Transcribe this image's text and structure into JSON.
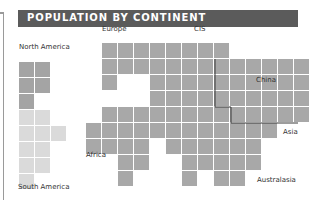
{
  "chart_data": {
    "type": "table",
    "subtype": "tile-map (cartogram)",
    "title": "POPULATION BY CONTINENT",
    "cell_size_px": 16,
    "colors": {
      "title_bar": "#5b5b5b",
      "title_text": "#ffffff",
      "tile_default": "#a8a8a8",
      "tile_north_america": "#a4a4a4",
      "tile_south_america": "#dadada",
      "border_line": "#3a3a3a"
    },
    "regions": [
      {
        "name": "North America",
        "label_x": 19,
        "label_y": 51
      },
      {
        "name": "South America",
        "label_x": 18,
        "label_y": 191
      },
      {
        "name": "Europe",
        "label_x": 102,
        "label_y": 33
      },
      {
        "name": "CIS",
        "label_x": 194,
        "label_y": 33
      },
      {
        "name": "China",
        "label_x": 256,
        "label_y": 84
      },
      {
        "name": "Asia",
        "label_x": 283,
        "label_y": 136
      },
      {
        "name": "Africa",
        "label_x": 86,
        "label_y": 159
      },
      {
        "name": "Australasia",
        "label_x": 257,
        "label_y": 184
      }
    ],
    "tiles": [
      {
        "x": 19,
        "y": 62,
        "r": "na"
      },
      {
        "x": 35,
        "y": 62,
        "r": "na"
      },
      {
        "x": 19,
        "y": 78,
        "r": "na"
      },
      {
        "x": 35,
        "y": 78,
        "r": "na"
      },
      {
        "x": 19,
        "y": 94,
        "r": "na"
      },
      {
        "x": 19,
        "y": 110,
        "r": "sa"
      },
      {
        "x": 35,
        "y": 110,
        "r": "sa"
      },
      {
        "x": 19,
        "y": 126,
        "r": "sa"
      },
      {
        "x": 35,
        "y": 126,
        "r": "sa"
      },
      {
        "x": 51,
        "y": 126,
        "r": "sa"
      },
      {
        "x": 19,
        "y": 142,
        "r": "sa"
      },
      {
        "x": 35,
        "y": 142,
        "r": "sa"
      },
      {
        "x": 19,
        "y": 158,
        "r": "sa"
      },
      {
        "x": 35,
        "y": 158,
        "r": "sa"
      },
      {
        "x": 19,
        "y": 174,
        "r": "sa"
      },
      {
        "x": 102,
        "y": 43
      },
      {
        "x": 118,
        "y": 43
      },
      {
        "x": 134,
        "y": 43
      },
      {
        "x": 150,
        "y": 43
      },
      {
        "x": 166,
        "y": 43
      },
      {
        "x": 182,
        "y": 43
      },
      {
        "x": 198,
        "y": 43
      },
      {
        "x": 214,
        "y": 43
      },
      {
        "x": 102,
        "y": 59
      },
      {
        "x": 118,
        "y": 59
      },
      {
        "x": 134,
        "y": 59
      },
      {
        "x": 150,
        "y": 59
      },
      {
        "x": 166,
        "y": 59
      },
      {
        "x": 182,
        "y": 59
      },
      {
        "x": 198,
        "y": 59
      },
      {
        "x": 214,
        "y": 59
      },
      {
        "x": 230,
        "y": 59
      },
      {
        "x": 246,
        "y": 59
      },
      {
        "x": 262,
        "y": 59
      },
      {
        "x": 278,
        "y": 59
      },
      {
        "x": 294,
        "y": 59
      },
      {
        "x": 102,
        "y": 75
      },
      {
        "x": 150,
        "y": 75
      },
      {
        "x": 166,
        "y": 75
      },
      {
        "x": 182,
        "y": 75
      },
      {
        "x": 198,
        "y": 75
      },
      {
        "x": 214,
        "y": 75
      },
      {
        "x": 230,
        "y": 75
      },
      {
        "x": 246,
        "y": 75
      },
      {
        "x": 262,
        "y": 75
      },
      {
        "x": 278,
        "y": 75
      },
      {
        "x": 294,
        "y": 75
      },
      {
        "x": 150,
        "y": 91
      },
      {
        "x": 166,
        "y": 91
      },
      {
        "x": 182,
        "y": 91
      },
      {
        "x": 198,
        "y": 91
      },
      {
        "x": 214,
        "y": 91
      },
      {
        "x": 230,
        "y": 91
      },
      {
        "x": 246,
        "y": 91
      },
      {
        "x": 262,
        "y": 91
      },
      {
        "x": 278,
        "y": 91
      },
      {
        "x": 294,
        "y": 91
      },
      {
        "x": 102,
        "y": 107
      },
      {
        "x": 118,
        "y": 107
      },
      {
        "x": 134,
        "y": 107
      },
      {
        "x": 150,
        "y": 107
      },
      {
        "x": 166,
        "y": 107
      },
      {
        "x": 182,
        "y": 107
      },
      {
        "x": 198,
        "y": 107
      },
      {
        "x": 214,
        "y": 107
      },
      {
        "x": 230,
        "y": 107
      },
      {
        "x": 246,
        "y": 107
      },
      {
        "x": 262,
        "y": 107
      },
      {
        "x": 278,
        "y": 107
      },
      {
        "x": 294,
        "y": 107
      },
      {
        "x": 86,
        "y": 123
      },
      {
        "x": 102,
        "y": 123
      },
      {
        "x": 118,
        "y": 123
      },
      {
        "x": 134,
        "y": 123
      },
      {
        "x": 150,
        "y": 123
      },
      {
        "x": 166,
        "y": 123
      },
      {
        "x": 182,
        "y": 123
      },
      {
        "x": 198,
        "y": 123
      },
      {
        "x": 214,
        "y": 123
      },
      {
        "x": 230,
        "y": 123
      },
      {
        "x": 246,
        "y": 123
      },
      {
        "x": 262,
        "y": 123
      },
      {
        "x": 86,
        "y": 139
      },
      {
        "x": 102,
        "y": 139
      },
      {
        "x": 118,
        "y": 139
      },
      {
        "x": 134,
        "y": 139
      },
      {
        "x": 166,
        "y": 139
      },
      {
        "x": 182,
        "y": 139
      },
      {
        "x": 198,
        "y": 139
      },
      {
        "x": 214,
        "y": 139
      },
      {
        "x": 230,
        "y": 139
      },
      {
        "x": 246,
        "y": 139
      },
      {
        "x": 118,
        "y": 155
      },
      {
        "x": 134,
        "y": 155
      },
      {
        "x": 182,
        "y": 155
      },
      {
        "x": 198,
        "y": 155
      },
      {
        "x": 214,
        "y": 155
      },
      {
        "x": 230,
        "y": 155
      },
      {
        "x": 246,
        "y": 155
      },
      {
        "x": 118,
        "y": 171
      },
      {
        "x": 182,
        "y": 171
      },
      {
        "x": 214,
        "y": 171
      },
      {
        "x": 230,
        "y": 171
      }
    ],
    "china_border_path": "M215,59 L215,107 L231,107 L231,123 L298,123"
  }
}
